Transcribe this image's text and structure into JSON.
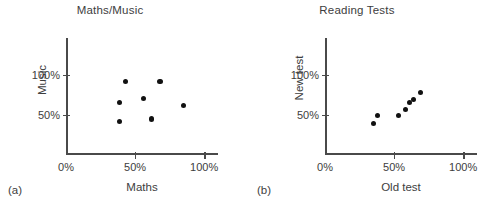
{
  "figure": {
    "panels": [
      {
        "tag": "(a)",
        "title": "Maths/Music",
        "xlabel": "Maths",
        "ylabel": "Music",
        "xticks": [
          "0%",
          "50%",
          "100%"
        ],
        "yticks": [
          "50%",
          "100%"
        ]
      },
      {
        "tag": "(b)",
        "title": "Reading Tests",
        "xlabel": "Old test",
        "ylabel": "New test",
        "xticks": [
          "0%",
          "50%",
          "100%"
        ],
        "yticks": [
          "50%",
          "100%"
        ]
      }
    ]
  },
  "chart_data": [
    {
      "type": "scatter",
      "title": "Maths/Music",
      "panel": "(a)",
      "xlabel": "Maths",
      "ylabel": "Music",
      "xlim": [
        0,
        110
      ],
      "ylim": [
        0,
        146
      ],
      "xticks": [
        0,
        50,
        100
      ],
      "yticks": [
        50,
        100
      ],
      "xticklabels": [
        "0%",
        "50%",
        "100%"
      ],
      "yticklabels": [
        "50%",
        "100%"
      ],
      "grid": false,
      "legend": null,
      "marker": "filled-circle",
      "marker_color": "#111111",
      "points": [
        {
          "x": 43,
          "y": 92
        },
        {
          "x": 39,
          "y": 66
        },
        {
          "x": 56,
          "y": 70
        },
        {
          "x": 39,
          "y": 42
        },
        {
          "x": 62,
          "y": 45
        },
        {
          "x": 68,
          "y": 92
        },
        {
          "x": 85,
          "y": 62
        }
      ]
    },
    {
      "type": "scatter",
      "title": "Reading Tests",
      "panel": "(b)",
      "xlabel": "Old test",
      "ylabel": "New test",
      "xlim": [
        0,
        110
      ],
      "ylim": [
        0,
        146
      ],
      "xticks": [
        0,
        50,
        100
      ],
      "yticks": [
        50,
        100
      ],
      "xticklabels": [
        "0%",
        "50%",
        "100%"
      ],
      "yticklabels": [
        "50%",
        "100%"
      ],
      "grid": false,
      "legend": null,
      "marker": "filled-circle",
      "marker_color": "#111111",
      "points": [
        {
          "x": 35,
          "y": 39
        },
        {
          "x": 38,
          "y": 49
        },
        {
          "x": 53,
          "y": 49
        },
        {
          "x": 58,
          "y": 57
        },
        {
          "x": 61,
          "y": 66
        },
        {
          "x": 64,
          "y": 69
        },
        {
          "x": 69,
          "y": 78
        }
      ]
    }
  ]
}
